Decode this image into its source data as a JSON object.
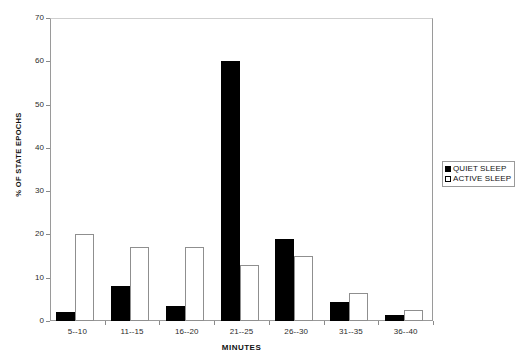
{
  "chart_data": {
    "type": "bar",
    "title": "",
    "xlabel": "MINUTES",
    "ylabel": "% OF STATE EPOCHS",
    "categories": [
      "5--10",
      "11--15",
      "16--20",
      "21--25",
      "26--30",
      "31--35",
      "36--40"
    ],
    "series": [
      {
        "name": "QUIET SLEEP",
        "values": [
          2,
          8,
          3.5,
          60,
          19,
          4.5,
          1.5
        ]
      },
      {
        "name": "ACTIVE SLEEP",
        "values": [
          20,
          17,
          17,
          13,
          15,
          6.5,
          2.5
        ]
      }
    ],
    "ylim": [
      0,
      70
    ],
    "yticks": [
      0,
      10,
      20,
      30,
      40,
      50,
      60,
      70
    ],
    "ytick_labels": [
      "0",
      "10",
      "20",
      "30",
      "40",
      "50",
      "60",
      "70"
    ],
    "grid": false,
    "legend_position": "right",
    "colors": {
      "quiet_sleep": "#000000",
      "active_sleep": "#ffffff",
      "bar_outline": "#8f8f8f",
      "axis": "#9a9a9a",
      "text": "#111111",
      "background": "#ffffff"
    }
  },
  "legend": {
    "entries": [
      {
        "label": "QUIET SLEEP",
        "swatch": "filled-square"
      },
      {
        "label": "ACTIVE SLEEP",
        "swatch": "open-square"
      }
    ]
  }
}
